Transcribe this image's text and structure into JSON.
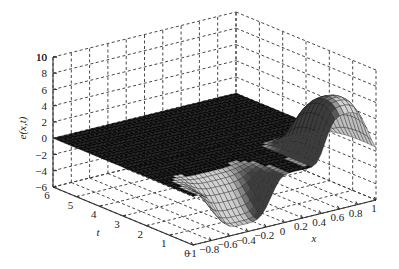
{
  "chart_data": {
    "type": "surface3d",
    "title": "",
    "xlabel": "x",
    "ylabel": "t",
    "zlabel": "e(x,t)",
    "x_ticks": [
      "-1",
      "-0.8",
      "-0.6",
      "-0.4",
      "-0.2",
      "0",
      "0.2",
      "0.4",
      "0.6",
      "0.8",
      "1"
    ],
    "t_ticks": [
      "0",
      "1",
      "2",
      "3",
      "4",
      "5",
      "6"
    ],
    "z_ticks": [
      "-6",
      "-4",
      "-2",
      "0",
      "2",
      "4",
      "6",
      "8",
      "10"
    ],
    "z_ticks_top": "10",
    "xlim": [
      -1,
      1
    ],
    "tlim": [
      0,
      6
    ],
    "zlim": [
      -6,
      10
    ],
    "grid": true,
    "grid_style": "dashed",
    "colormap": "grayscale",
    "features": {
      "peak": {
        "x": 0.7,
        "t": 1.2,
        "z": 6.5
      },
      "trough": {
        "x": -0.5,
        "t": 0.3,
        "z": -5.0
      },
      "flat_level": 0
    }
  }
}
